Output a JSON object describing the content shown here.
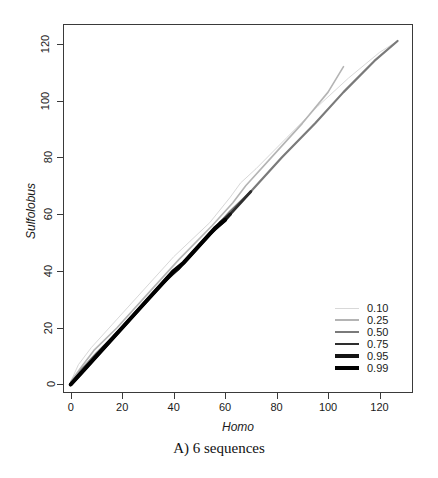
{
  "figure": {
    "caption": "A) 6 sequences"
  },
  "axes": {
    "x": {
      "label": "Homo",
      "ticks": [
        0,
        20,
        40,
        60,
        80,
        100,
        120
      ],
      "range": [
        -3,
        133
      ]
    },
    "y": {
      "label": "Sulfolobus",
      "ticks": [
        0,
        20,
        40,
        60,
        80,
        100,
        120
      ],
      "range": [
        -3,
        127
      ]
    }
  },
  "legend": {
    "position": "bottom-right",
    "entries": [
      {
        "label": "0.10",
        "color": "#d8d8d8",
        "width": 1.0
      },
      {
        "label": "0.25",
        "color": "#b4b4b4",
        "width": 1.6
      },
      {
        "label": "0.50",
        "color": "#7a7a7a",
        "width": 2.2
      },
      {
        "label": "0.75",
        "color": "#2e2e2e",
        "width": 2.8
      },
      {
        "label": "0.95",
        "color": "#141414",
        "width": 3.4
      },
      {
        "label": "0.99",
        "color": "#000000",
        "width": 4.0
      }
    ]
  },
  "chart_data": {
    "type": "line",
    "title": "A) 6 sequences",
    "xlabel": "Homo",
    "ylabel": "Sulfolobus",
    "xlim": [
      -3,
      133
    ],
    "ylim": [
      -3,
      127
    ],
    "grid": false,
    "legend_position": "bottom-right",
    "series": [
      {
        "name": "0.99",
        "color": "#000000",
        "width": 4.0,
        "x": [
          0,
          5,
          12,
          20,
          28,
          36,
          40,
          44,
          50,
          56,
          60
        ],
        "y": [
          0,
          5,
          12,
          20,
          28,
          36,
          40,
          43,
          49,
          55,
          58
        ]
      },
      {
        "name": "0.95",
        "color": "#141414",
        "width": 3.4,
        "x": [
          0,
          6,
          14,
          22,
          30,
          38,
          42,
          48,
          54,
          60,
          62
        ],
        "y": [
          0,
          6,
          14,
          22,
          30,
          38,
          41,
          47,
          53,
          58,
          60
        ]
      },
      {
        "name": "0.75",
        "color": "#2e2e2e",
        "width": 2.8,
        "x": [
          0,
          6,
          15,
          25,
          35,
          42,
          50,
          58,
          62,
          66,
          70
        ],
        "y": [
          0,
          6,
          15,
          25,
          35,
          41,
          49,
          57,
          60,
          64,
          68
        ]
      },
      {
        "name": "0.50",
        "color": "#7a7a7a",
        "width": 2.2,
        "x": [
          0,
          4,
          10,
          20,
          32,
          44,
          55,
          62,
          70,
          82,
          95,
          106,
          118,
          127
        ],
        "y": [
          0,
          5,
          11,
          20,
          32,
          43,
          54,
          61,
          68,
          80,
          92,
          103,
          114,
          121
        ]
      },
      {
        "name": "0.25",
        "color": "#b4b4b4",
        "width": 1.6,
        "x": [
          0,
          4,
          9,
          18,
          30,
          42,
          55,
          63,
          68,
          78,
          90,
          100,
          106
        ],
        "y": [
          1,
          6,
          12,
          20,
          32,
          44,
          56,
          64,
          70,
          80,
          92,
          103,
          112
        ]
      },
      {
        "name": "0.10",
        "color": "#d8d8d8",
        "width": 1.0,
        "x": [
          0,
          3,
          8,
          16,
          28,
          40,
          54,
          62,
          66,
          72,
          84,
          96,
          108,
          120,
          127
        ],
        "y": [
          1,
          7,
          13,
          21,
          33,
          45,
          57,
          66,
          71,
          76,
          87,
          98,
          108,
          117,
          121
        ]
      }
    ]
  }
}
